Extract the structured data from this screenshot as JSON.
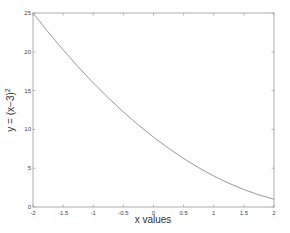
{
  "chart_data": {
    "type": "line",
    "title": "",
    "xlabel": "x values",
    "ylabel": "y = (x−3)",
    "ylabel_superscript": "2",
    "xlim": [
      -2,
      2
    ],
    "ylim": [
      0,
      25
    ],
    "xticks": [
      -2,
      -1.5,
      -1,
      -0.5,
      0,
      0.5,
      1,
      1.5,
      2
    ],
    "xtick_labels": [
      "-2",
      "-1.5",
      "-1",
      "-0.5",
      "0",
      "0.5",
      "1",
      "1.5",
      "2"
    ],
    "yticks": [
      0,
      5,
      10,
      15,
      20,
      25
    ],
    "ytick_labels": [
      "0",
      "5",
      "10",
      "15",
      "20",
      "25"
    ],
    "grid": false,
    "legend": null,
    "series": [
      {
        "name": "y = (x-3)^2",
        "color": "#8c8c8c",
        "x": [
          -2,
          -1.75,
          -1.5,
          -1.25,
          -1,
          -0.75,
          -0.5,
          -0.25,
          0,
          0.25,
          0.5,
          0.75,
          1,
          1.25,
          1.5,
          1.75,
          2
        ],
        "y": [
          25,
          22.5625,
          20.25,
          18.0625,
          16,
          14.0625,
          12.25,
          10.5625,
          9,
          7.5625,
          6.25,
          5.0625,
          4,
          3.0625,
          2.25,
          1.5625,
          1
        ]
      }
    ]
  }
}
